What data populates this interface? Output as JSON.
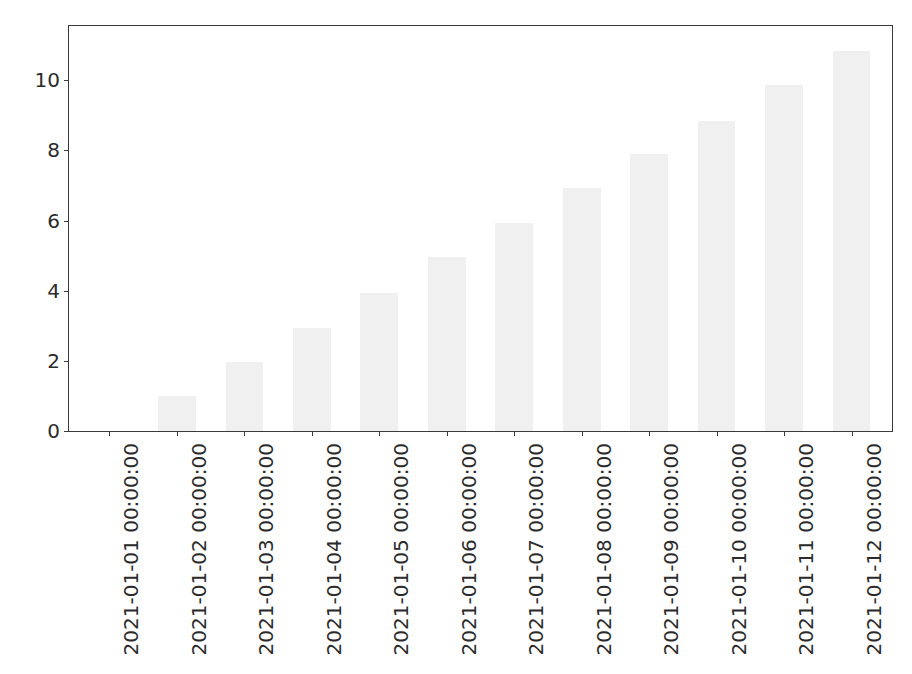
{
  "chart_data": {
    "type": "bar",
    "title": "",
    "xlabel": "",
    "ylabel": "",
    "categories": [
      "2021-01-01 00:00:00",
      "2021-01-02 00:00:00",
      "2021-01-03 00:00:00",
      "2021-01-04 00:00:00",
      "2021-01-05 00:00:00",
      "2021-01-06 00:00:00",
      "2021-01-07 00:00:00",
      "2021-01-08 00:00:00",
      "2021-01-09 00:00:00",
      "2021-01-10 00:00:00",
      "2021-01-11 00:00:00",
      "2021-01-12 00:00:00"
    ],
    "values": [
      0,
      0.99,
      1.97,
      2.95,
      3.94,
      4.95,
      5.93,
      6.93,
      7.9,
      8.85,
      9.86,
      10.85
    ],
    "ylim": [
      0,
      11.55
    ],
    "yticks": [
      0,
      2,
      4,
      6,
      8,
      10
    ],
    "ytick_labels": [
      "0",
      "2",
      "4",
      "6",
      "8",
      "10"
    ],
    "xlim": [
      -0.6,
      11.6
    ],
    "grid": false,
    "legend": null,
    "bar_color": "#f0f0f0",
    "axis_color": "#3a3a3a",
    "tick_label_color": "#2b2b2b",
    "bar_width_fraction": 0.56,
    "xtick_label_rotation": 90
  }
}
